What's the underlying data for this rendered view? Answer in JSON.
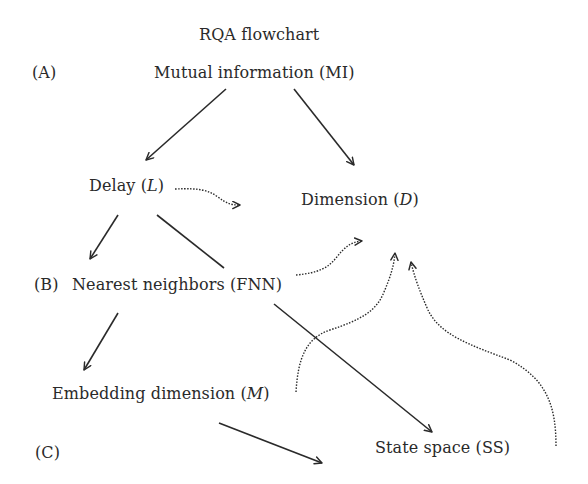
{
  "title": "RQA flowchart",
  "section_labels": {
    "a": "(A)",
    "b": "(B)",
    "c": "(C)"
  },
  "nodes": {
    "mi": {
      "text": "Mutual information (MI)"
    },
    "delay": {
      "prefix": "Delay (",
      "var": "L",
      "suffix": ")"
    },
    "dimension": {
      "prefix": "Dimension (",
      "var": "D",
      "suffix": ")"
    },
    "fnn": {
      "text": "Nearest neighbors (FNN)"
    },
    "embedding": {
      "prefix": "Embedding dimension (",
      "var": "M",
      "suffix": ")"
    },
    "state_space": {
      "text": "State space (SS)"
    }
  },
  "edges": [
    {
      "from": "Mutual information (MI)",
      "to": "Delay (L)",
      "style": "solid"
    },
    {
      "from": "Mutual information (MI)",
      "to": "Dimension (D)",
      "style": "solid"
    },
    {
      "from": "Delay (L)",
      "to": "Dimension (D)",
      "style": "dotted"
    },
    {
      "from": "Delay (L)",
      "to": "Nearest neighbors (FNN)",
      "style": "solid"
    },
    {
      "from": "Delay (L)",
      "to": "State space (SS)",
      "style": "solid"
    },
    {
      "from": "Nearest neighbors (FNN)",
      "to": "Dimension (D)",
      "style": "dotted"
    },
    {
      "from": "Nearest neighbors (FNN)",
      "to": "Embedding dimension (M)",
      "style": "solid"
    },
    {
      "from": "Embedding dimension (M)",
      "to": "Dimension (D)",
      "style": "dotted"
    },
    {
      "from": "Embedding dimension (M)",
      "to": "State space (SS)",
      "style": "solid"
    },
    {
      "from": "State space (SS)",
      "to": "Dimension (D)",
      "style": "dotted"
    }
  ],
  "colors": {
    "text": "#2a2a2a",
    "line": "#2a2a2a",
    "background": "#ffffff"
  }
}
